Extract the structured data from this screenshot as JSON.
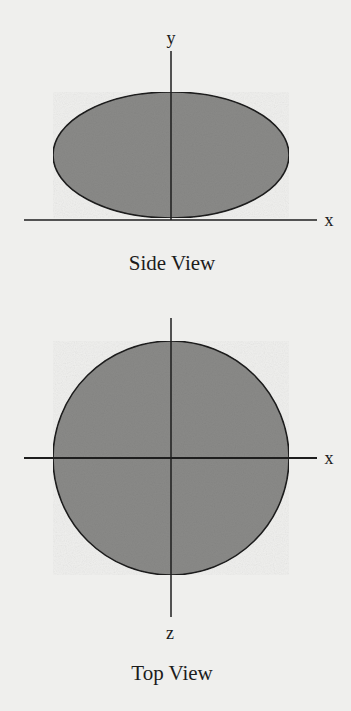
{
  "colors": {
    "background": "#efefed",
    "shape_fill": "#8a8a88",
    "outline": "#1e1e1e",
    "axis": "#1e1e1e",
    "text": "#1c1c1c"
  },
  "side_view": {
    "caption": "Side View",
    "axes": {
      "horizontal_label": "x",
      "vertical_label": "y"
    },
    "shape": "ellipse",
    "shape_description": "oblate ellipse resting on the x-axis, wider than tall"
  },
  "top_view": {
    "caption": "Top View",
    "axes": {
      "horizontal_label": "x",
      "vertical_label": "z"
    },
    "shape": "circle",
    "shape_description": "circle centered at the origin of the x–z axes"
  }
}
